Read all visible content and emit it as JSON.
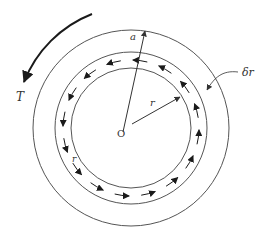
{
  "figure": {
    "labels": {
      "torque": "T",
      "outer_radius": "a",
      "ring_radius": "r",
      "ring_radius_left": "r",
      "ring_thickness": "δr",
      "center": "O"
    },
    "arrow_direction": "counter-clockwise",
    "ring_arrow_count": 16,
    "colors": {
      "line": "#555555",
      "arrow": "#1a1a1a",
      "text": "#333333"
    }
  }
}
